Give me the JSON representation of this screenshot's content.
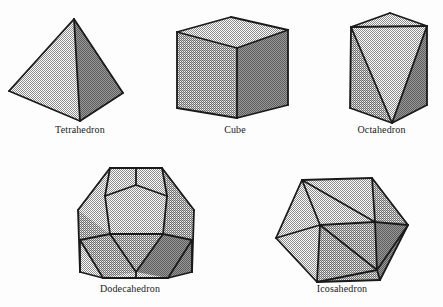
{
  "figure": {
    "background_color": "#fdfdfd",
    "stroke_color": "#1a1a1a",
    "shade_light": "#d2d2d2",
    "shade_medium": "#b4b4b4",
    "shade_dark": "#999999",
    "shade_darker": "#8a8a8a"
  },
  "labels": {
    "tetrahedron": "Tetrahedron",
    "cube": "Cube",
    "octahedron": "Octahedron",
    "dodecahedron": "Dodecahedron",
    "icosahedron": "Icosahedron"
  },
  "chart_data": {
    "type": "diagram",
    "xlabel": "",
    "ylabel": "",
    "legend": [],
    "grid": false,
    "categories": [
      "Tetrahedron",
      "Cube",
      "Octahedron",
      "Dodecahedron",
      "Icosahedron"
    ],
    "items": [
      {
        "name": "Tetrahedron",
        "faces": 4,
        "vertices": 4,
        "edges": 6,
        "face_shape": "triangle",
        "label": "Tetrahedron",
        "row": 1,
        "column": 1,
        "outline_points": "74,19 9,91 80,121 123,93",
        "polygons": [
          {
            "id": "tetra-face-left",
            "shade": "light",
            "points": "74,19 9,91 80,121"
          },
          {
            "id": "tetra-face-right",
            "shade": "dark",
            "points": "74,19 80,121 123,93"
          }
        ],
        "edges_list": [
          {
            "id": "tetra-edge-apex-left",
            "points": "74,19 9,91"
          },
          {
            "id": "tetra-edge-left-bottom",
            "points": "9,91 80,121"
          },
          {
            "id": "tetra-edge-bottom-right",
            "points": "80,121 123,93"
          },
          {
            "id": "tetra-edge-right-apex",
            "points": "123,93 74,19"
          },
          {
            "id": "tetra-edge-apex-bottom",
            "points": "74,19 80,121"
          }
        ]
      },
      {
        "name": "Cube",
        "faces": 6,
        "vertices": 8,
        "edges": 12,
        "face_shape": "square",
        "label": "Cube",
        "row": 1,
        "column": 2,
        "outline_points": "231,17 288,30 288,105 237,118 177,108 177,32",
        "polygons": [
          {
            "id": "cube-face-top",
            "shade": "light",
            "points": "231,17 288,30 237,48 177,32"
          },
          {
            "id": "cube-face-left",
            "shade": "medium",
            "points": "177,32 237,48 237,118 177,108"
          },
          {
            "id": "cube-face-right",
            "shade": "dark",
            "points": "237,48 288,30 288,105 237,118"
          }
        ],
        "edges_list": [
          {
            "id": "cube-edge-top-back-left",
            "points": "231,17 177,32"
          },
          {
            "id": "cube-edge-top-back-right",
            "points": "231,17 288,30"
          },
          {
            "id": "cube-edge-top-front-left",
            "points": "177,32 237,48"
          },
          {
            "id": "cube-edge-top-front-right",
            "points": "237,48 288,30"
          },
          {
            "id": "cube-edge-vertical-left",
            "points": "177,32 177,108"
          },
          {
            "id": "cube-edge-vertical-center",
            "points": "237,48 237,118"
          },
          {
            "id": "cube-edge-vertical-right",
            "points": "288,30 288,105"
          },
          {
            "id": "cube-edge-bottom-left",
            "points": "177,108 237,118"
          },
          {
            "id": "cube-edge-bottom-right",
            "points": "237,118 288,105"
          }
        ]
      },
      {
        "name": "Octahedron",
        "faces": 8,
        "vertices": 6,
        "edges": 12,
        "face_shape": "triangle",
        "label": "Octahedron",
        "row": 1,
        "column": 3,
        "outline_points": "390,13 427,26 427,105 392,123 350,108 351,27",
        "polygons": [
          {
            "id": "octa-face-top",
            "shade": "light",
            "points": "390,13 427,26 351,27"
          },
          {
            "id": "octa-face-left",
            "shade": "medium",
            "points": "351,27 350,108 392,123"
          },
          {
            "id": "octa-face-center",
            "shade": "light",
            "points": "351,27 392,123 427,26"
          },
          {
            "id": "octa-face-right",
            "shade": "dark",
            "points": "427,26 427,105 392,123"
          }
        ],
        "edges_list": [
          {
            "id": "octa-edge-apex-left",
            "points": "390,13 351,27"
          },
          {
            "id": "octa-edge-apex-right",
            "points": "390,13 427,26"
          },
          {
            "id": "octa-edge-upper-horizontal",
            "points": "351,27 427,26"
          },
          {
            "id": "octa-edge-left-vertical",
            "points": "351,27 350,108"
          },
          {
            "id": "octa-edge-right-vertical",
            "points": "427,26 427,105"
          },
          {
            "id": "octa-edge-bottom-left",
            "points": "350,108 392,123"
          },
          {
            "id": "octa-edge-bottom-right",
            "points": "392,123 427,105"
          },
          {
            "id": "octa-edge-diag-left",
            "points": "351,27 392,123"
          },
          {
            "id": "octa-edge-diag-right",
            "points": "427,26 392,123"
          }
        ]
      },
      {
        "name": "Dodecahedron",
        "faces": 12,
        "vertices": 20,
        "edges": 30,
        "face_shape": "pentagon",
        "label": "Dodecahedron",
        "row": 2,
        "column": 1,
        "outline_points": "110,168 162,168 194,210 192,272 168,278 103,278 80,272 78,210",
        "polygons": [
          {
            "id": "dodeca-face-front",
            "shade": "light",
            "points": "105,196 136,185 167,196 163,234 110,234"
          },
          {
            "id": "dodeca-face-top",
            "shade": "light",
            "points": "110,168 162,168 167,196 136,185 105,196"
          },
          {
            "id": "dodeca-face-upper-left",
            "shade": "light",
            "points": "110,168 105,196 110,234 80,240 78,210"
          },
          {
            "id": "dodeca-face-upper-right",
            "shade": "medium",
            "points": "162,168 194,210 192,240 163,234 167,196"
          },
          {
            "id": "dodeca-face-lower-left",
            "shade": "medium",
            "points": "78,210 80,240 103,278 136,272 110,234"
          },
          {
            "id": "dodeca-face-bottom",
            "shade": "medium",
            "points": "110,234 136,272 163,234"
          },
          {
            "id": "dodeca-face-lower-right",
            "shade": "dark",
            "points": "163,234 136,272 168,278 192,272 192,240"
          }
        ],
        "edges_list": [
          {
            "id": "dodeca-outline-top-left",
            "points": "110,168 162,168"
          },
          {
            "id": "dodeca-outline-upper-right",
            "points": "162,168 194,210"
          },
          {
            "id": "dodeca-outline-right",
            "points": "194,210 192,272"
          },
          {
            "id": "dodeca-outline-lower-right",
            "points": "192,272 168,278"
          },
          {
            "id": "dodeca-outline-bottom",
            "points": "168,278 103,278"
          },
          {
            "id": "dodeca-outline-lower-left",
            "points": "103,278 80,272"
          },
          {
            "id": "dodeca-outline-left",
            "points": "80,272 78,210"
          },
          {
            "id": "dodeca-outline-upper-left",
            "points": "78,210 110,168"
          },
          {
            "id": "dodeca-edge-front-tl",
            "points": "105,196 136,185"
          },
          {
            "id": "dodeca-edge-front-tr",
            "points": "136,185 167,196"
          },
          {
            "id": "dodeca-edge-front-r",
            "points": "167,196 163,234"
          },
          {
            "id": "dodeca-edge-front-b",
            "points": "163,234 110,234"
          },
          {
            "id": "dodeca-edge-front-l",
            "points": "110,234 105,196"
          },
          {
            "id": "dodeca-edge-spoke-top",
            "points": "136,185 136,168"
          },
          {
            "id": "dodeca-edge-spoke-ul",
            "points": "105,196 110,168"
          },
          {
            "id": "dodeca-edge-spoke-ur",
            "points": "167,196 162,168"
          },
          {
            "id": "dodeca-edge-spoke-ll",
            "points": "110,234 80,240"
          },
          {
            "id": "dodeca-edge-spoke-lr",
            "points": "163,234 192,240"
          },
          {
            "id": "dodeca-edge-left-lower",
            "points": "80,240 80,272"
          },
          {
            "id": "dodeca-edge-right-lower",
            "points": "192,240 192,272"
          },
          {
            "id": "dodeca-edge-bottom-left-diag",
            "points": "110,234 136,272"
          },
          {
            "id": "dodeca-edge-bottom-right-diag",
            "points": "163,234 136,272"
          },
          {
            "id": "dodeca-edge-bottom-stem",
            "points": "136,272 136,278"
          },
          {
            "id": "dodeca-edge-ll-to-bottom",
            "points": "80,240 103,278"
          },
          {
            "id": "dodeca-edge-lr-to-bottom",
            "points": "192,240 168,278"
          }
        ]
      },
      {
        "name": "Icosahedron",
        "faces": 20,
        "vertices": 12,
        "edges": 30,
        "face_shape": "triangle",
        "label": "Icosahedron",
        "row": 2,
        "column": 2,
        "outline_points": "302,180 372,178 408,225 380,280 317,282 276,238",
        "polygons": [
          {
            "id": "icosa-face-1",
            "shade": "light",
            "points": "302,180 372,178 375,222"
          },
          {
            "id": "icosa-face-2",
            "shade": "light",
            "points": "302,180 375,222 320,225"
          },
          {
            "id": "icosa-face-3",
            "shade": "light",
            "points": "302,180 320,225 276,238"
          },
          {
            "id": "icosa-face-4",
            "shade": "light",
            "points": "276,238 320,225 317,282"
          },
          {
            "id": "icosa-face-5",
            "shade": "medium",
            "points": "320,225 375,222 377,270"
          },
          {
            "id": "icosa-face-6",
            "shade": "medium",
            "points": "320,225 377,270 317,282"
          },
          {
            "id": "icosa-face-7",
            "shade": "medium",
            "points": "372,178 408,225 375,222"
          },
          {
            "id": "icosa-face-8",
            "shade": "dark",
            "points": "375,222 408,225 377,270"
          },
          {
            "id": "icosa-face-9",
            "shade": "dark",
            "points": "377,270 408,225 380,280"
          },
          {
            "id": "icosa-face-10",
            "shade": "medium",
            "points": "317,282 377,270 380,280"
          }
        ],
        "edges_list": [
          {
            "id": "icosa-outline-top",
            "points": "302,180 372,178"
          },
          {
            "id": "icosa-outline-upper-right",
            "points": "372,178 408,225"
          },
          {
            "id": "icosa-outline-lower-right",
            "points": "408,225 380,280"
          },
          {
            "id": "icosa-outline-bottom",
            "points": "380,280 317,282"
          },
          {
            "id": "icosa-outline-lower-left",
            "points": "317,282 276,238"
          },
          {
            "id": "icosa-outline-upper-left",
            "points": "276,238 302,180"
          },
          {
            "id": "icosa-edge-a",
            "points": "302,180 320,225"
          },
          {
            "id": "icosa-edge-b",
            "points": "302,180 375,222"
          },
          {
            "id": "icosa-edge-c",
            "points": "372,178 375,222"
          },
          {
            "id": "icosa-edge-d",
            "points": "276,238 320,225"
          },
          {
            "id": "icosa-edge-e",
            "points": "320,225 375,222"
          },
          {
            "id": "icosa-edge-f",
            "points": "320,225 317,282"
          },
          {
            "id": "icosa-edge-g",
            "points": "320,225 377,270"
          },
          {
            "id": "icosa-edge-h",
            "points": "375,222 377,270"
          },
          {
            "id": "icosa-edge-i",
            "points": "375,222 408,225"
          },
          {
            "id": "icosa-edge-j",
            "points": "377,270 317,282"
          },
          {
            "id": "icosa-edge-k",
            "points": "377,270 408,225"
          },
          {
            "id": "icosa-edge-l",
            "points": "377,270 380,280"
          }
        ]
      }
    ]
  }
}
